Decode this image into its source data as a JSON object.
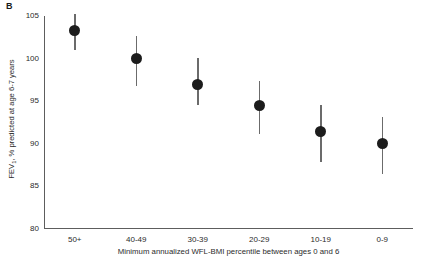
{
  "panel": {
    "label": "B"
  },
  "chart_data": {
    "type": "scatter",
    "title": "",
    "subtitle": "",
    "xlabel": "Minimum annualized WFL-BMI percentile between ages 0 and 6",
    "ylabel": "FEV1, % predicted at age 6-7 years",
    "ylabel_prefix": "FEV",
    "ylabel_subscript": "1",
    "ylabel_suffix": ", % predicted at age 6-7 years",
    "categories": [
      "50+",
      "40-49",
      "30-39",
      "20-29",
      "10-19",
      "0-9"
    ],
    "values": [
      103.3,
      100.0,
      97.0,
      94.5,
      91.5,
      90.0
    ],
    "ci_low": [
      101.0,
      96.8,
      94.5,
      91.2,
      87.9,
      86.5
    ],
    "ci_high": [
      105.2,
      102.6,
      100.1,
      97.4,
      94.5,
      93.2
    ],
    "ylim": [
      80,
      105
    ],
    "yticks": [
      105,
      100,
      95,
      90,
      85,
      80
    ],
    "ytick_labels": [
      "105",
      "100",
      "95",
      "90",
      "85",
      "80"
    ],
    "grid": false,
    "legend": "none",
    "marker_color": "#1c1c1c",
    "errorbar_color": "#6b6b6b",
    "axis_color": "#5d5d5d",
    "error_representation": "95% confidence interval"
  }
}
